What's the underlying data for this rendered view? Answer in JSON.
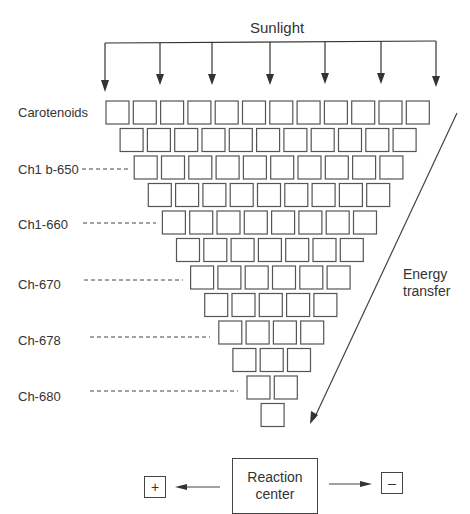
{
  "diagram": {
    "title": "Sunlight",
    "sunlight_arrow_count": 7,
    "pigment_rows": [
      {
        "count": 12,
        "label": "Carotenoids"
      },
      {
        "count": 11,
        "label": ""
      },
      {
        "count": 10,
        "label": "Ch1 b-650"
      },
      {
        "count": 9,
        "label": ""
      },
      {
        "count": 8,
        "label": "Ch1-660"
      },
      {
        "count": 7,
        "label": ""
      },
      {
        "count": 6,
        "label": "Ch-670"
      },
      {
        "count": 5,
        "label": ""
      },
      {
        "count": 4,
        "label": "Ch-678"
      },
      {
        "count": 3,
        "label": ""
      },
      {
        "count": 2,
        "label": "Ch-680"
      },
      {
        "count": 1,
        "label": ""
      }
    ],
    "labels": {
      "carotenoids": "Carotenoids",
      "chl_b_650": "Ch1 b-650",
      "chl_660": "Ch1-660",
      "ch_670": "Ch-670",
      "ch_678": "Ch-678",
      "ch_680": "Ch-680"
    },
    "energy_transfer": {
      "line1": "Energy",
      "line2": "transfer"
    },
    "reaction_center": {
      "line1": "Reaction",
      "line2": "center"
    },
    "positive_charge": "+",
    "negative_charge": "–",
    "colors": {
      "stroke": "#444444",
      "background": "#ffffff",
      "text": "#333333"
    }
  }
}
